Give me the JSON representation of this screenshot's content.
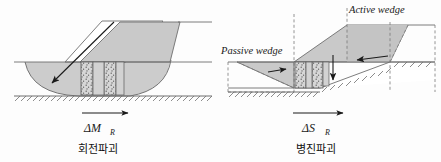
{
  "figure": {
    "title_visible": false,
    "background_color": "#fdfdfd",
    "line_color": "#4d4d4d",
    "fill_color": "#c9c9c9",
    "accent_color": "#1a1a1a"
  },
  "left_panel": {
    "name": "rotational-failure-diagram",
    "force_symbol": "ΔM",
    "force_subscript": "R",
    "caption_korean": "회전파괴",
    "arrow_direction": "right",
    "slip_arrow": "down-left"
  },
  "right_panel": {
    "name": "translational-failure-diagram",
    "force_symbol": "ΔS",
    "force_subscript": "R",
    "caption_korean": "병진파괴",
    "active_wedge_label": "Active wedge",
    "passive_wedge_label": "Passive wedge",
    "arrow_direction": "right",
    "active_arrow": "left",
    "settlement_arrow": "down",
    "passive_arrow": "right"
  }
}
